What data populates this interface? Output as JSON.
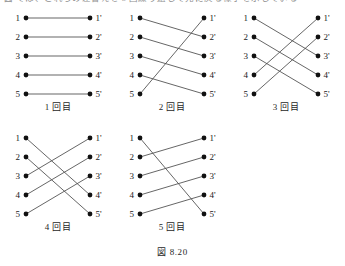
{
  "page": {
    "cut_header_text": "図 では、これらの差替えを 5 回繰り返して元に戻る様子を示している",
    "figure_caption": "図 8.20",
    "line_color": "#4a4a4a",
    "node_color": "#111111",
    "text_color": "#1a1a1a",
    "background": "#ffffff"
  },
  "diagram_data": {
    "type": "permutation-diagram-series",
    "description": "Five bipartite permutation diagrams showing cyclic shifts of five elements",
    "node_count": 5,
    "left_labels": [
      "1",
      "2",
      "3",
      "4",
      "5"
    ],
    "right_labels": [
      "1'",
      "2'",
      "3'",
      "4'",
      "5'"
    ],
    "panels": [
      {
        "caption": "1 回目",
        "shift": 0,
        "edges": [
          {
            "from": 1,
            "to": 1
          },
          {
            "from": 2,
            "to": 2
          },
          {
            "from": 3,
            "to": 3
          },
          {
            "from": 4,
            "to": 4
          },
          {
            "from": 5,
            "to": 5
          }
        ]
      },
      {
        "caption": "2 回目",
        "shift": 1,
        "edges": [
          {
            "from": 1,
            "to": 2
          },
          {
            "from": 2,
            "to": 3
          },
          {
            "from": 3,
            "to": 4
          },
          {
            "from": 4,
            "to": 5
          },
          {
            "from": 5,
            "to": 1
          }
        ]
      },
      {
        "caption": "3 回目",
        "shift": 2,
        "edges": [
          {
            "from": 1,
            "to": 3
          },
          {
            "from": 2,
            "to": 4
          },
          {
            "from": 3,
            "to": 5
          },
          {
            "from": 4,
            "to": 1
          },
          {
            "from": 5,
            "to": 2
          }
        ]
      },
      {
        "caption": "4 回目",
        "shift": 3,
        "edges": [
          {
            "from": 1,
            "to": 4
          },
          {
            "from": 2,
            "to": 5
          },
          {
            "from": 3,
            "to": 1
          },
          {
            "from": 4,
            "to": 2
          },
          {
            "from": 5,
            "to": 3
          }
        ]
      },
      {
        "caption": "5 回目",
        "shift": 4,
        "edges": [
          {
            "from": 1,
            "to": 5
          },
          {
            "from": 2,
            "to": 1
          },
          {
            "from": 3,
            "to": 2
          },
          {
            "from": 4,
            "to": 3
          },
          {
            "from": 5,
            "to": 4
          }
        ]
      }
    ],
    "layout": {
      "rows": [
        [
          0,
          1,
          2
        ],
        [
          3,
          4
        ]
      ],
      "panel_positions": [
        {
          "left": 4,
          "top": 8
        },
        {
          "left": 118,
          "top": 8
        },
        {
          "left": 232,
          "top": 8
        },
        {
          "left": 4,
          "top": 128
        },
        {
          "left": 118,
          "top": 128
        }
      ]
    }
  }
}
